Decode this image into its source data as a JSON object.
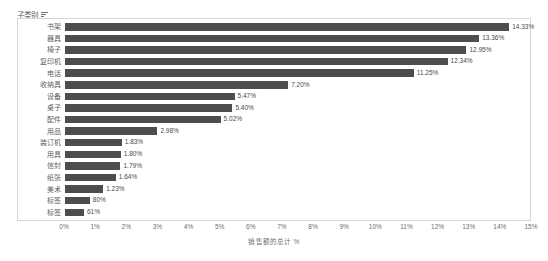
{
  "header": {
    "field_label": "子类别",
    "sort_icon": "sort-descending-icon"
  },
  "axis": {
    "x_title": "销售额的总计 %",
    "x_ticks": [
      "0%",
      "1%",
      "2%",
      "3%",
      "4%",
      "5%",
      "6%",
      "7%",
      "8%",
      "9%",
      "10%",
      "11%",
      "12%",
      "13%",
      "14%",
      "15%"
    ]
  },
  "colors": {
    "bar": "#4d4d4d",
    "frame": "#d6d6d6",
    "text": "#5f5f5f"
  },
  "chart_data": {
    "type": "bar",
    "orientation": "horizontal",
    "title": "",
    "xlabel": "销售额的总计 %",
    "ylabel": "子类别",
    "xlim": [
      0,
      15
    ],
    "grid": false,
    "legend": "none",
    "categories": [
      "书架",
      "器具",
      "椅子",
      "复印机",
      "电话",
      "收纳具",
      "设备",
      "桌子",
      "配件",
      "用品",
      "装订机",
      "用具",
      "信封",
      "纸张",
      "美术",
      "标签",
      "标签"
    ],
    "values": [
      14.33,
      13.36,
      12.95,
      12.34,
      11.25,
      7.2,
      5.47,
      5.4,
      5.02,
      2.98,
      1.83,
      1.8,
      1.79,
      1.64,
      1.23,
      0.8,
      0.61
    ],
    "value_labels": [
      "14.33%",
      "13.36%",
      "12.95%",
      "12.34%",
      "11.25%",
      "7.20%",
      "5.47%",
      "5.40%",
      "5.02%",
      "2.98%",
      "1.83%",
      "1.80%",
      "1.79%",
      "1.64%",
      "1.23%",
      "80%",
      "61%"
    ]
  }
}
